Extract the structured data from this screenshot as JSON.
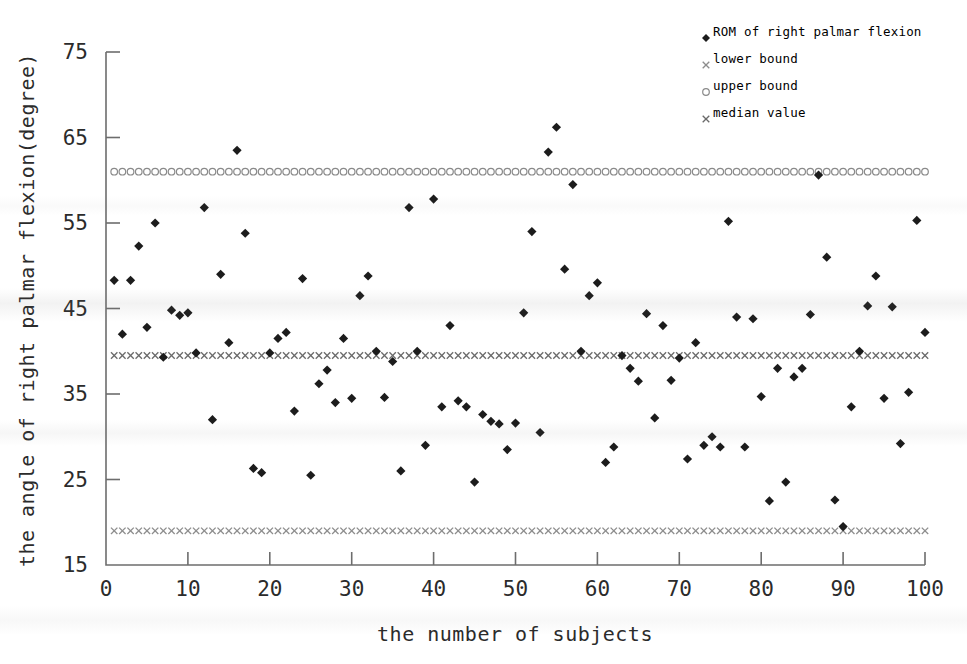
{
  "chart_data": {
    "type": "scatter",
    "title": "",
    "xlabel": "the number of subjects",
    "ylabel": "the angle of right palmar flexion(degree)",
    "xlim": [
      0,
      100
    ],
    "ylim": [
      15,
      75
    ],
    "xticks": [
      0,
      10,
      20,
      30,
      40,
      50,
      60,
      70,
      80,
      90,
      100
    ],
    "yticks": [
      15,
      25,
      35,
      45,
      55,
      65,
      75
    ],
    "grid": false,
    "legend_position": "top-right",
    "legend": [
      {
        "label": "ROM of right palmar flexion",
        "marker": "diamond"
      },
      {
        "label": "lower bound",
        "marker": "x"
      },
      {
        "label": "upper bound",
        "marker": "circle-open"
      },
      {
        "label": "median value",
        "marker": "x"
      }
    ],
    "reference_lines": [
      {
        "name": "upper bound",
        "value": 61.0,
        "marker": "circle-open"
      },
      {
        "name": "median value",
        "value": 39.5,
        "marker": "x"
      },
      {
        "name": "lower bound",
        "value": 19.0,
        "marker": "x"
      }
    ],
    "series": [
      {
        "name": "ROM of right palmar flexion",
        "marker": "diamond",
        "x": [
          1,
          2,
          3,
          4,
          5,
          6,
          7,
          8,
          9,
          10,
          11,
          12,
          13,
          14,
          15,
          16,
          17,
          18,
          19,
          20,
          21,
          22,
          23,
          24,
          25,
          26,
          27,
          28,
          29,
          30,
          31,
          32,
          33,
          34,
          35,
          36,
          37,
          38,
          39,
          40,
          41,
          42,
          43,
          44,
          45,
          46,
          47,
          48,
          49,
          50,
          51,
          52,
          53,
          54,
          55,
          56,
          57,
          58,
          59,
          60,
          61,
          62,
          63,
          64,
          65,
          66,
          67,
          68,
          69,
          70,
          71,
          72,
          73,
          74,
          75,
          76,
          77,
          78,
          79,
          80,
          81,
          82,
          83,
          84,
          85,
          86,
          87,
          88,
          89,
          90,
          91,
          92,
          93,
          94,
          95,
          96,
          97,
          98,
          99,
          100
        ],
        "y": [
          48.3,
          42.0,
          48.3,
          52.3,
          42.8,
          55.0,
          39.3,
          44.8,
          44.2,
          44.5,
          39.8,
          56.8,
          32.0,
          49.0,
          41.0,
          63.5,
          53.8,
          26.3,
          25.8,
          39.8,
          41.5,
          42.2,
          33.0,
          48.5,
          25.5,
          36.2,
          37.8,
          34.0,
          41.5,
          34.5,
          46.5,
          48.8,
          40.0,
          34.6,
          38.8,
          26.0,
          56.8,
          40.0,
          29.0,
          57.8,
          33.5,
          43.0,
          34.2,
          33.5,
          24.7,
          32.6,
          31.8,
          31.5,
          28.5,
          31.6,
          44.5,
          54.0,
          30.5,
          63.3,
          66.2,
          49.6,
          59.5,
          40.0,
          46.5,
          48.0,
          27.0,
          28.8,
          39.5,
          38.0,
          36.5,
          44.4,
          32.2,
          43.0,
          36.6,
          39.2,
          27.4,
          41.0,
          29.0,
          30.0,
          28.8,
          55.2,
          44.0,
          28.8,
          43.8,
          34.7,
          22.5,
          38.0,
          24.7,
          37.0,
          38.0,
          44.3,
          60.6,
          51.0,
          22.6,
          19.5,
          33.5,
          40.0,
          45.3,
          48.8,
          34.5,
          45.2,
          29.2,
          35.2,
          55.3,
          42.2
        ]
      }
    ]
  }
}
